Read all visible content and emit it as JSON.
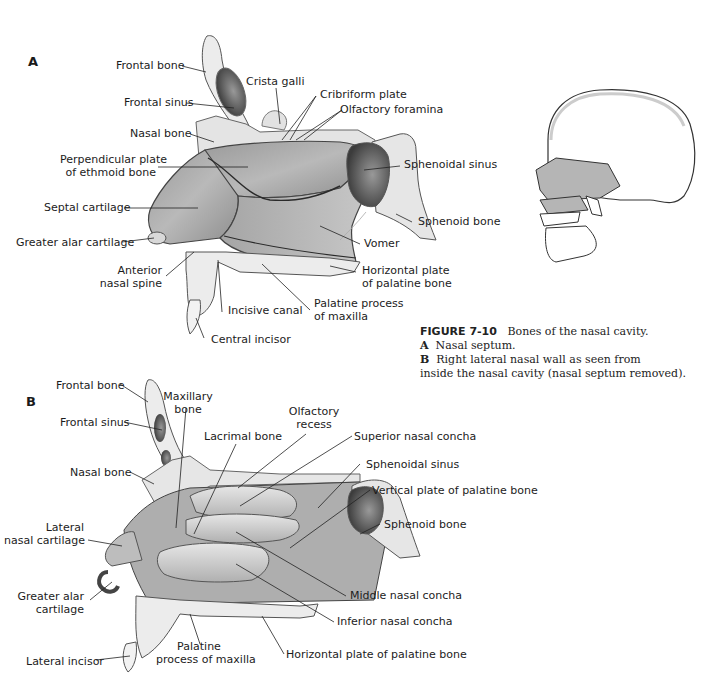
{
  "figure": {
    "number": "FIGURE 7-10",
    "title": "Bones of the nasal cavity.",
    "items": [
      {
        "key": "A",
        "text": "Nasal septum."
      },
      {
        "key": "B",
        "text": "Right lateral nasal wall as seen from",
        "cont": "inside the nasal cavity (nasal septum removed)."
      }
    ]
  },
  "panel_a": {
    "letter": "A",
    "labels": {
      "frontal_bone": "Frontal bone",
      "crista_galli": "Crista galli",
      "cribriform_plate": "Cribriform plate",
      "olfactory_foramina": "Olfactory foramina",
      "frontal_sinus": "Frontal sinus",
      "nasal_bone": "Nasal bone",
      "perp_plate_1": "Perpendicular plate",
      "perp_plate_2": "of ethmoid bone",
      "sphenoidal_sinus": "Sphenoidal sinus",
      "septal_cartilage": "Septal cartilage",
      "sphenoid_bone": "Sphenoid bone",
      "greater_alar": "Greater alar cartilage",
      "vomer": "Vomer",
      "anterior_1": "Anterior",
      "anterior_2": "nasal spine",
      "horizontal_1": "Horizontal plate",
      "horizontal_2": "of palatine bone",
      "incisive_canal": "Incisive canal",
      "palatine_1": "Palatine process",
      "palatine_2": "of maxilla",
      "central_incisor": "Central incisor"
    }
  },
  "panel_b": {
    "letter": "B",
    "labels": {
      "frontal_bone": "Frontal bone",
      "maxillary_1": "Maxillary",
      "maxillary_2": "bone",
      "olfactory_1": "Olfactory",
      "olfactory_2": "recess",
      "frontal_sinus": "Frontal sinus",
      "lacrimal_bone": "Lacrimal bone",
      "superior_concha": "Superior nasal concha",
      "sphenoidal_sinus": "Sphenoidal sinus",
      "nasal_bone": "Nasal bone",
      "vertical_plate": "Vertical plate of palatine bone",
      "sphenoid_bone": "Sphenoid bone",
      "lateral_cart_1": "Lateral",
      "lateral_cart_2": "nasal cartilage",
      "middle_concha": "Middle nasal concha",
      "greater_alar_1": "Greater alar",
      "greater_alar_2": "cartilage",
      "inferior_concha": "Inferior nasal concha",
      "palatine_1": "Palatine",
      "palatine_2": "process of maxilla",
      "lateral_incisor": "Lateral incisor",
      "horizontal_plate": "Horizontal plate of palatine bone"
    }
  },
  "colors": {
    "bone_light": "#ebebeb",
    "bone_mid": "#b8b8b8",
    "bone_dark": "#8a8a8a",
    "sinus_dark": "#555555",
    "skull_shade": "#b5b5b5",
    "leader": "#222222"
  }
}
